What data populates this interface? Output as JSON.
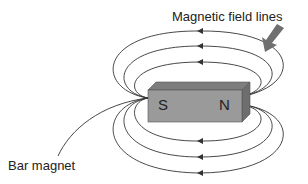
{
  "diagram": {
    "title_label": "Magnetic field lines",
    "magnet_label": "Bar magnet",
    "poles": {
      "south": "S",
      "north": "N"
    },
    "colors": {
      "magnet_front": "#9a9a9a",
      "magnet_top": "#7d7d7d",
      "magnet_side": "#6e6e6e",
      "lines": "#333333",
      "arrow": "#6f6f6f"
    }
  }
}
